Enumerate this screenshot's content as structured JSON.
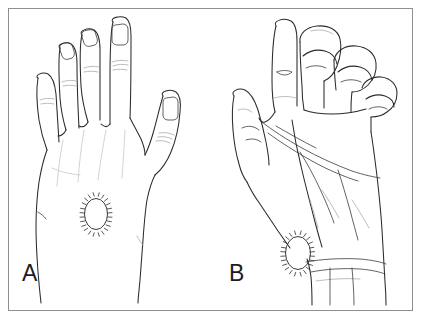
{
  "figure": {
    "caption_labels": {
      "panel_a": "A",
      "panel_b": "B"
    },
    "frame": {
      "border_color": "#8e8e93",
      "background_color": "#ffffff"
    },
    "line_color": "#2b2b2f",
    "faint_line_color": "#9a9aa0",
    "panels": [
      {
        "id": "panel-a",
        "label": "A",
        "view": "dorsal hand view",
        "hand": "left hand, fingers extended, thumb abducted to the right",
        "marking": {
          "name": "lesion-marking-oval",
          "shape": "oval with hatched border",
          "location": "dorsum of hand, over third metacarpal",
          "center_x": 96,
          "center_y": 214,
          "radius_x": 12,
          "radius_y": 16
        }
      },
      {
        "id": "panel-b",
        "label": "B",
        "view": "palmar hand view",
        "hand": "left hand, index finger and thumb extended, middle/ring/little fingers flexed",
        "marking": {
          "name": "lesion-marking-oval",
          "shape": "oval with hatched border",
          "location": "radial wrist / thenar base",
          "center_x": 298,
          "center_y": 253,
          "radius_x": 13,
          "radius_y": 17
        }
      }
    ]
  }
}
